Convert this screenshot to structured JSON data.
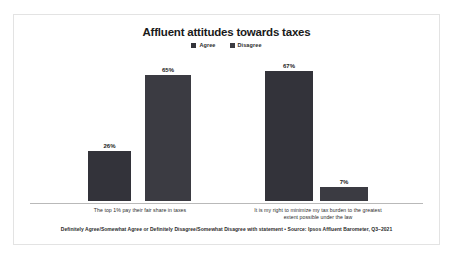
{
  "chart_data": {
    "type": "bar",
    "title": "Affluent attitudes towards taxes",
    "categories": [
      "The top 1% pay their fair share in taxes",
      "It is my right to minimize my tax burden to the greatest extent possible under the law"
    ],
    "series": [
      {
        "name": "Agree",
        "values": [
          26,
          67
        ],
        "color": "#33333a"
      },
      {
        "name": "Disagree",
        "values": [
          65,
          7
        ],
        "color": "#3b3b42"
      }
    ],
    "value_labels": [
      "26%",
      "65%",
      "67%",
      "7%"
    ],
    "xlabel": "",
    "ylabel": "",
    "ylim": [
      0,
      75
    ],
    "grid": false,
    "legend_position": "top-center",
    "footnote": "Definitely Agree/Somewhat Agree or Definitely Disagree/Somewhat Disagree with statement  •  Source: Ipsos Affluent Barometer, Q3–2021"
  },
  "bars": [
    {
      "label": "26%",
      "group": 0,
      "series": "Agree"
    },
    {
      "label": "65%",
      "group": 0,
      "series": "Disagree"
    },
    {
      "label": "67%",
      "group": 1,
      "series": "Agree"
    },
    {
      "label": "7%",
      "group": 1,
      "series": "Disagree"
    }
  ],
  "legend": {
    "items": [
      {
        "label": "Agree"
      },
      {
        "label": "Disagree"
      }
    ]
  }
}
